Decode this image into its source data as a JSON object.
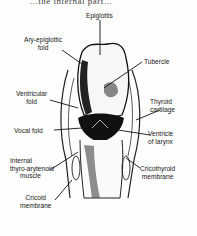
{
  "header": {
    "cutoff_text": "...the internal part..."
  },
  "figure": {
    "labels": {
      "epiglottis": "Epiglottis",
      "ary_epiglottic_fold": [
        "Ary-epiglottic",
        "fold"
      ],
      "tubercle": "Tubercle",
      "ventricular_fold": [
        "Ventricular",
        "fold"
      ],
      "thyroid_cartilage": [
        "Thyroid",
        "cartilage"
      ],
      "vocal_fold": "Vocal fold",
      "ventricle_of_larynx": [
        "Ventricle",
        "of larynx"
      ],
      "internal_thyro_arytenoid_muscle": [
        "Internal",
        "thyro-arytenoid",
        "muscle"
      ],
      "cricothyroid_membrane": [
        "Cricothyroid",
        "membrane"
      ],
      "cricoid_membrane": [
        "Cricoid",
        "membrane"
      ]
    }
  }
}
